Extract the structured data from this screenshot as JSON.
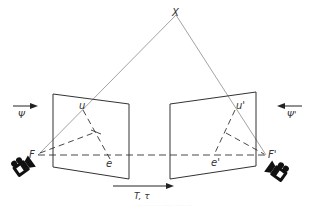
{
  "diagram": {
    "type": "epipolar-geometry",
    "labels": {
      "world_point": "X",
      "left_focal": "F",
      "right_focal": "F'",
      "left_image_point": "u",
      "right_image_point": "u'",
      "left_epipole": "e",
      "right_epipole": "e'",
      "left_rotation": "Ψ",
      "right_rotation": "Ψ'",
      "translation": "T, τ"
    },
    "caption": "··· ···· ·· ··· ······ ·· ······ ····"
  },
  "colors": {
    "plane_stroke": "#333333",
    "ray_stroke": "#8a8a8a",
    "dashed_stroke": "#333333",
    "camera_fill": "#111111",
    "text": "#333333"
  }
}
